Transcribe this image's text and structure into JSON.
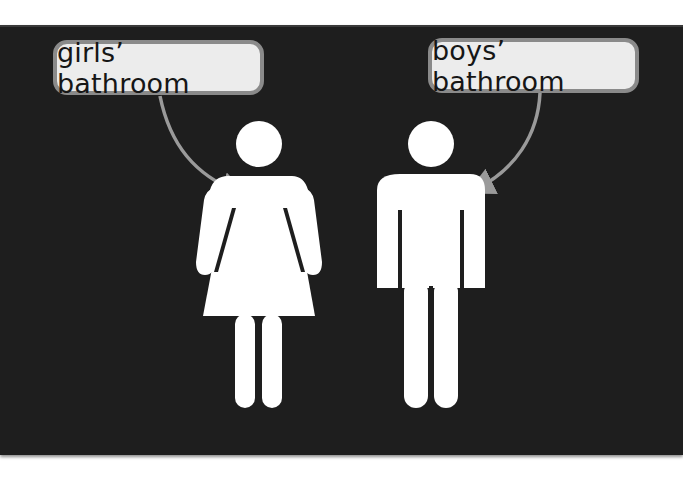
{
  "labels": {
    "girls": "girls’ bathroom",
    "boys": "boys’ bathroom"
  },
  "figures": [
    {
      "name": "female-restroom-figure",
      "points_to": "girls"
    },
    {
      "name": "male-restroom-figure",
      "points_to": "boys"
    }
  ],
  "colors": {
    "background": "#1e1e1e",
    "label_fill": "#ececec",
    "label_border": "#8a8a8a",
    "arrow": "#9a9a9a",
    "figure": "#ffffff"
  }
}
